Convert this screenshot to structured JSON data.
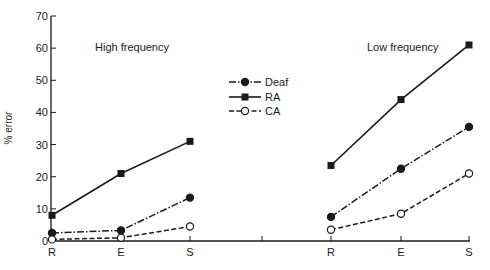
{
  "chart_data": {
    "type": "line",
    "title": "",
    "xlabel": "",
    "ylabel": "% error",
    "ylim": [
      0,
      70
    ],
    "yticks": [
      0,
      10,
      20,
      30,
      40,
      50,
      60,
      70
    ],
    "grid": false,
    "legend_position": "top-center",
    "panels": [
      {
        "label": "High frequency",
        "categories": [
          "R",
          "E",
          "S"
        ],
        "series": [
          {
            "name": "Deaf",
            "style": "dash-dot, filled circle",
            "values": [
              2.5,
              3.3,
              13.5
            ]
          },
          {
            "name": "RA",
            "style": "solid, filled square",
            "values": [
              8,
              21,
              31
            ]
          },
          {
            "name": "CA",
            "style": "dashed, open circle",
            "values": [
              0.5,
              1,
              4.5
            ]
          }
        ]
      },
      {
        "label": "Low frequency",
        "categories": [
          "R",
          "E",
          "S"
        ],
        "series": [
          {
            "name": "Deaf",
            "style": "dash-dot, filled circle",
            "values": [
              7.5,
              22.5,
              35.5
            ]
          },
          {
            "name": "RA",
            "style": "solid, filled square",
            "values": [
              23.5,
              44,
              61
            ]
          },
          {
            "name": "CA",
            "style": "dashed, open circle",
            "values": [
              3.5,
              8.5,
              21
            ]
          }
        ]
      }
    ]
  },
  "legend": {
    "items": [
      {
        "label": "Deaf"
      },
      {
        "label": "RA"
      },
      {
        "label": "CA"
      }
    ]
  },
  "colors": {
    "ink": "#1a1a1a",
    "background": "#ffffff"
  }
}
